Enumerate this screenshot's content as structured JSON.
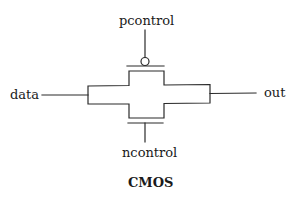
{
  "diagram": {
    "title": "CMOS",
    "labels": {
      "pcontrol": "pcontrol",
      "ncontrol": "ncontrol",
      "input": "data",
      "output": "out"
    },
    "components": [
      {
        "id": "pmos",
        "type": "p-channel transistor",
        "gate": "pcontrol",
        "inverted_gate": true
      },
      {
        "id": "nmos",
        "type": "n-channel transistor",
        "gate": "ncontrol",
        "inverted_gate": false
      }
    ],
    "connections": [
      {
        "from": "data",
        "to": "transmission-gate-left"
      },
      {
        "from": "transmission-gate-right",
        "to": "out"
      },
      {
        "from": "pcontrol",
        "to": "pmos-gate"
      },
      {
        "from": "ncontrol",
        "to": "nmos-gate"
      }
    ],
    "colors": {
      "stroke": "#2a2a2a",
      "text": "#1a1a1a",
      "background": "#ffffff"
    }
  }
}
